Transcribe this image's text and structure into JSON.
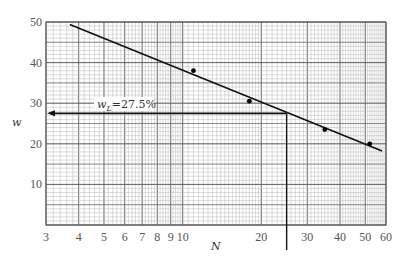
{
  "chart_data": {
    "type": "scatter",
    "title": "",
    "xlabel": "N",
    "ylabel": "w",
    "xscale": "log",
    "xlim": [
      3,
      60
    ],
    "ylim": [
      0,
      50
    ],
    "grid": true,
    "x_ticks": [
      3,
      4,
      5,
      6,
      7,
      8,
      9,
      10,
      20,
      30,
      40,
      50,
      60
    ],
    "x_tick_labels": [
      "3",
      "4",
      "5",
      "6",
      "7",
      "8",
      "9",
      "10",
      "20",
      "30",
      "40",
      "50",
      "60"
    ],
    "y_ticks": [
      10,
      20,
      30,
      40,
      50
    ],
    "y_tick_labels": [
      "10",
      "20",
      "30",
      "40",
      "50"
    ],
    "series": [
      {
        "name": "measured points",
        "x": [
          11,
          18,
          35,
          52
        ],
        "y": [
          38,
          30.5,
          23.5,
          20
        ]
      }
    ],
    "fit_line": {
      "x": [
        3.7,
        58
      ],
      "y": [
        49.4,
        18.2
      ]
    },
    "annotation": {
      "label": "w_L=27.5%",
      "label_main": "w",
      "label_sub": "L",
      "label_rest": "=27.5%",
      "y_value": 27.5,
      "x_value": 25
    },
    "legend": null
  },
  "colors": {
    "grid_minor": "#b8b8b8",
    "grid_major": "#555555",
    "line": "#111111",
    "text": "#555555"
  }
}
